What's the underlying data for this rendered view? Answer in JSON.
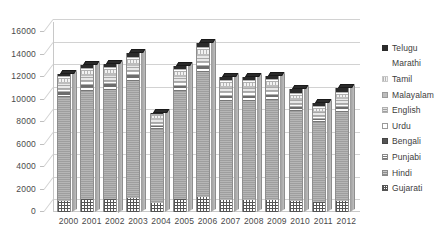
{
  "chart_data": {
    "type": "bar",
    "subtype": "stacked-column-3d",
    "title": "",
    "xlabel": "",
    "ylabel": "",
    "ylim": [
      0,
      16000
    ],
    "ytick_step": 2000,
    "yticks": [
      "16000",
      "14000",
      "12000",
      "10000",
      "8000",
      "6000",
      "4000",
      "2000",
      "0"
    ],
    "grid": true,
    "legend_position": "right",
    "categories": [
      "2000",
      "2001",
      "2002",
      "2003",
      "2004",
      "2005",
      "2006",
      "2007",
      "2008",
      "2009",
      "2010",
      "2011",
      "2012"
    ],
    "series": [
      {
        "name": "Gujarati",
        "color": "#555555",
        "values": [
          980,
          1150,
          1120,
          1260,
          760,
          1140,
          1330,
          1050,
          1060,
          1070,
          940,
          860,
          990
        ]
      },
      {
        "name": "Hindi",
        "color": "#9e9e9e",
        "values": [
          9200,
          9650,
          9750,
          10400,
          6600,
          9600,
          11100,
          8850,
          8850,
          8900,
          8000,
          7100,
          7900
        ]
      },
      {
        "name": "Punjabi",
        "color": "#777777",
        "values": [
          250,
          270,
          270,
          290,
          180,
          260,
          300,
          240,
          240,
          250,
          220,
          190,
          240
        ]
      },
      {
        "name": "Bengali",
        "color": "#6d6d6d",
        "values": [
          200,
          215,
          215,
          230,
          145,
          210,
          245,
          195,
          195,
          195,
          175,
          155,
          195
        ]
      },
      {
        "name": "Urdu",
        "color": "#ffffff",
        "values": [
          310,
          330,
          330,
          350,
          220,
          325,
          370,
          295,
          295,
          300,
          270,
          240,
          290
        ]
      },
      {
        "name": "English",
        "color": "#e8e8e8",
        "values": [
          420,
          445,
          450,
          480,
          300,
          440,
          510,
          405,
          405,
          410,
          365,
          325,
          400
        ]
      },
      {
        "name": "Malayalam",
        "color": "#bdbdbd",
        "values": [
          195,
          205,
          210,
          225,
          140,
          205,
          235,
          190,
          190,
          190,
          170,
          150,
          185
        ]
      },
      {
        "name": "Tamil",
        "color": "#f2f2f2",
        "values": [
          230,
          245,
          245,
          265,
          165,
          240,
          280,
          220,
          220,
          225,
          200,
          180,
          215
        ]
      },
      {
        "name": "Marathi",
        "color": "#ffffff",
        "values": [
          265,
          280,
          285,
          300,
          190,
          280,
          320,
          255,
          255,
          260,
          230,
          205,
          250
        ]
      },
      {
        "name": "Telugu",
        "color": "#2b2b2b",
        "values": [
          250,
          310,
          325,
          300,
          100,
          300,
          310,
          300,
          290,
          300,
          330,
          295,
          335
        ]
      }
    ],
    "totals": [
      12300,
      12900,
      13000,
      14100,
      8800,
      13000,
      15000,
      12000,
      12000,
      12100,
      10900,
      9700,
      11000
    ]
  },
  "legend": {
    "items": [
      {
        "label": "Telugu",
        "swatch": "sw-telugu"
      },
      {
        "label": "Marathi",
        "swatch": "sw-marathi"
      },
      {
        "label": "Tamil",
        "swatch": "sw-tamil"
      },
      {
        "label": "Malayalam",
        "swatch": "sw-malayalam"
      },
      {
        "label": "English",
        "swatch": "sw-english"
      },
      {
        "label": "Urdu",
        "swatch": "sw-urdu"
      },
      {
        "label": "Bengali",
        "swatch": "sw-bengali"
      },
      {
        "label": "Punjabi",
        "swatch": "sw-punjabi"
      },
      {
        "label": "Hindi",
        "swatch": "sw-hindi"
      },
      {
        "label": "Gujarati",
        "swatch": "sw-gujarati"
      }
    ]
  }
}
